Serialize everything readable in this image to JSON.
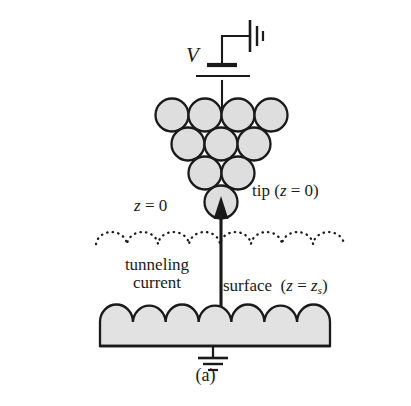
{
  "figure": {
    "caption": "(a)",
    "title_alt": "Scanning tunneling microscope tip and surface schematic"
  },
  "labels": {
    "voltage": "V",
    "tip": "tip (z = 0)",
    "z_zero": "z = 0",
    "tunneling_line1": "tunneling",
    "tunneling_line2": "current",
    "surface_prefix": "surface",
    "surface_paren_open": "(",
    "surface_z": "z",
    "surface_equals": "=",
    "surface_zs_base": "z",
    "surface_zs_sub": "s",
    "surface_paren_close": ")",
    "tip_text_plain": "tip",
    "tip_paren": "(z = 0)"
  },
  "colors": {
    "sphere_fill": "#dedede",
    "sphere_stroke": "#1a1a1a",
    "surface_fill": "#e2e2e2",
    "line": "#1a1a1a",
    "background": "#ffffff"
  },
  "geometry": {
    "atom_rows": [
      4,
      3,
      2,
      1
    ],
    "atom_radius": 16.5,
    "dotted_arcs": 8,
    "surface_scallops": 7,
    "surface_left": 100,
    "surface_right": 330,
    "dotted_left": 95,
    "dotted_right": 345
  },
  "components": {
    "battery": "voltage-source",
    "ground_top": "ground-symbol-rotated",
    "ground_bottom": "ground-symbol",
    "arrow": "tunneling-current-arrow"
  }
}
